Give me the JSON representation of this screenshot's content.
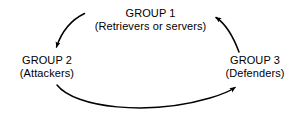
{
  "diagram": {
    "background_color": "#ffffff",
    "stroke_color": "#000000",
    "text_color": "#000000",
    "nodes": [
      {
        "id": "group1",
        "name": "GROUP 1",
        "description": "(Retrievers or servers)",
        "position": "top-center"
      },
      {
        "id": "group2",
        "name": "GROUP 2",
        "description": "(Attackers)",
        "position": "left"
      },
      {
        "id": "group3",
        "name": "GROUP 3",
        "description": "(Defenders)",
        "position": "right"
      }
    ],
    "arrows": [
      {
        "id": "group1-to-group2",
        "from": "group1",
        "to": "group2",
        "label": "",
        "direction": "curved down-left"
      },
      {
        "id": "group2-to-group3",
        "from": "group2",
        "to": "group3",
        "label": "",
        "direction": "curved bottom arc rightward"
      },
      {
        "id": "group3-to-group1",
        "from": "group3",
        "to": "group1",
        "label": "",
        "direction": "curved up-left"
      }
    ]
  }
}
